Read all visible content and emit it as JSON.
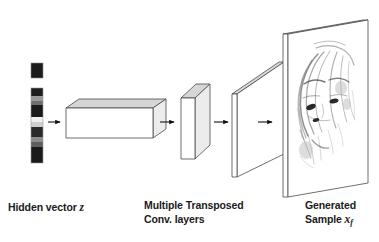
{
  "figure": {
    "type": "neural-network-architecture-diagram",
    "background_color": "#ffffff",
    "stroke_color": "#3a3a3a",
    "arrow_color": "#111111"
  },
  "labels": {
    "hidden_vector": {
      "text": "Hidden vector ",
      "symbol": "z"
    },
    "transposed_conv": {
      "line1": "Multiple Transposed",
      "line2": "Conv. layers"
    },
    "generated_sample": {
      "line1": "Generated",
      "line2": "Sample ",
      "symbol": "x",
      "subscript": "f"
    }
  },
  "stages": [
    {
      "name": "hidden-vector",
      "kind": "grayscale-vector",
      "detached_top_block": {
        "fill": "#1c1c1c"
      },
      "segments": [
        {
          "fill": "#1e1e1e"
        },
        {
          "fill": "#9a9a9a"
        },
        {
          "fill": "#6e6e6e"
        },
        {
          "fill": "#1a1a1a"
        },
        {
          "fill": "#1a1a1a"
        },
        {
          "fill": "#f0f0ee"
        },
        {
          "fill": "#cfcfcd"
        },
        {
          "fill": "#2a2a2a"
        },
        {
          "fill": "#8c8c8c"
        },
        {
          "fill": "#5f5f5f"
        },
        {
          "fill": "#1a1a1a"
        },
        {
          "fill": "#1a1a1a"
        }
      ]
    },
    {
      "name": "dense-projection-block",
      "kind": "cuboid-wide-flat",
      "face_fill": "#ffffff",
      "top_fill": "#d6d6d6",
      "side_fill": "#ebebeb"
    },
    {
      "name": "transposed-conv-block",
      "kind": "cuboid-tall-thin",
      "face_fill": "#ffffff",
      "top_fill": "#d6d6d6",
      "side_fill": "#ebebeb"
    },
    {
      "name": "feature-map-plane",
      "kind": "plane-thin",
      "face_fill": "#ffffff",
      "top_fill": "#d8d8d8"
    },
    {
      "name": "output-image-plane",
      "kind": "plane-with-image",
      "face_fill": "#ffffff",
      "top_fill": "#d8d8d8",
      "image": "generated-face-sample"
    }
  ],
  "arrows": [
    {
      "name": "arrow-vector-to-block"
    },
    {
      "name": "arrow-block-to-conv"
    },
    {
      "name": "arrow-conv-to-plane"
    },
    {
      "name": "arrow-plane-to-output"
    }
  ]
}
